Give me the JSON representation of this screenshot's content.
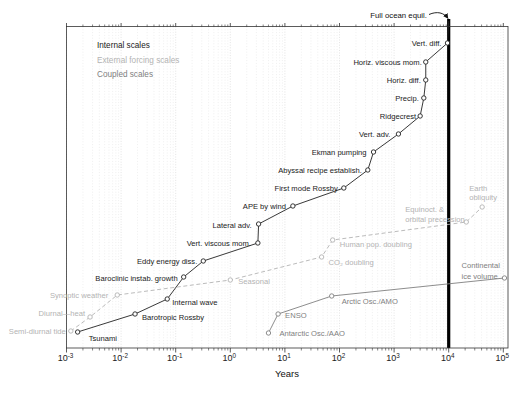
{
  "chart_data": {
    "type": "line",
    "title": "",
    "xlabel": "Years",
    "x_axis": {
      "scale": "log10",
      "min": 0.001,
      "max": 100000,
      "tick_exponents": [
        -3,
        -2,
        -1,
        0,
        1,
        2,
        3,
        4,
        5
      ],
      "unit": "years",
      "grid": "vertical dotted minor log gridlines"
    },
    "y_axis": {
      "visible": false,
      "note": "ordinal staircase, no numeric scale or ticks"
    },
    "legend_position": "top-left inside plot",
    "annotations": {
      "full_ocean_equil": {
        "label": "Full ocean equil.",
        "years": 10000,
        "style": "thick vertical black line with arrow from label"
      }
    },
    "series": [
      {
        "name": "Internal scales",
        "color": "#222222",
        "style": "solid",
        "points": [
          {
            "label": "Tsunami",
            "years": 0.0016,
            "y": 332,
            "dx": 11,
            "dy": 9,
            "anchor": "start"
          },
          {
            "label": "Barotropic Rossby",
            "years": 0.018,
            "y": 314,
            "dx": 7,
            "dy": 6,
            "anchor": "start"
          },
          {
            "label": "Internal wave",
            "years": 0.07,
            "y": 299,
            "dx": 5,
            "dy": 6,
            "anchor": "start"
          },
          {
            "label": "Baroclinic instab. growth",
            "years": 0.14,
            "y": 277,
            "dx": -6,
            "dy": 4,
            "anchor": "end"
          },
          {
            "label": "Eddy energy diss.",
            "years": 0.32,
            "y": 261,
            "dx": -6,
            "dy": 3,
            "anchor": "end"
          },
          {
            "label": "Vert. viscous mom.",
            "years": 3.2,
            "y": 243,
            "dx": -7,
            "dy": 3,
            "anchor": "end"
          },
          {
            "label": "Lateral adv.",
            "years": 3.3,
            "y": 224,
            "dx": -7,
            "dy": 4,
            "anchor": "end"
          },
          {
            "label": "APE by wind",
            "years": 14,
            "y": 206,
            "dx": -7,
            "dy": 3,
            "anchor": "end"
          },
          {
            "label": "First mode Rossby",
            "years": 120,
            "y": 188,
            "dx": -6,
            "dy": 3,
            "anchor": "end"
          },
          {
            "label": "Abyssal recipe establish.",
            "years": 330,
            "y": 170,
            "dx": -6,
            "dy": 3,
            "anchor": "end"
          },
          {
            "label": "Ekman pumping",
            "years": 420,
            "y": 152,
            "dx": -7,
            "dy": 3,
            "anchor": "end"
          },
          {
            "label": "Vert. adv.",
            "years": 1200,
            "y": 134,
            "dx": -8,
            "dy": 3,
            "anchor": "end"
          },
          {
            "label": "Ridgecrest",
            "years": 3000,
            "y": 116,
            "dx": -4,
            "dy": 3,
            "anchor": "end"
          },
          {
            "label": "Precip.",
            "years": 3500,
            "y": 98,
            "dx": -5,
            "dy": 3,
            "anchor": "end"
          },
          {
            "label": "Horiz. diff.",
            "years": 3800,
            "y": 80,
            "dx": -5,
            "dy": 3,
            "anchor": "end"
          },
          {
            "label": "Horiz. viscous mom.",
            "years": 3800,
            "y": 62,
            "dx": -4,
            "dy": 3,
            "anchor": "end"
          },
          {
            "label": "Vert. diff.",
            "years": 9500,
            "y": 43,
            "dx": -6,
            "dy": 3,
            "anchor": "end"
          },
          {
            "label": "",
            "years": 10000,
            "y": 21,
            "marker": false
          }
        ]
      },
      {
        "name": "External forcing scales",
        "color": "#b3b3b3",
        "style": "dashed",
        "points": [
          {
            "label": "Semi-diurnal tide",
            "years": 0.0012,
            "y": 331,
            "dx": -5,
            "dy": 3,
            "anchor": "end"
          },
          {
            "label": "Diurnal—heat",
            "years": 0.0027,
            "y": 317,
            "dx": -5,
            "dy": -1,
            "anchor": "end"
          },
          {
            "label": "Synoptic weather",
            "years": 0.0085,
            "y": 295,
            "dx": -9,
            "dy": 3,
            "anchor": "end"
          },
          {
            "label": "Seasonal",
            "years": 1.0,
            "y": 280,
            "dx": 8,
            "dy": 4,
            "anchor": "start"
          },
          {
            "label": "CO₂ doubling",
            "years": 47,
            "y": 257,
            "dx": 7,
            "dy": 8,
            "anchor": "start"
          },
          {
            "label": "Human pop. doubling",
            "years": 75,
            "y": 240,
            "dx": 7,
            "dy": 7,
            "anchor": "start"
          },
          {
            "label": "Equinoct. &\norbital precession",
            "years": 21000,
            "y": 222,
            "dx": -61,
            "dy": -10,
            "anchor": "start",
            "lh": 10
          },
          {
            "label": "Earth\nobliquity",
            "years": 41000,
            "y": 207,
            "dx": -13,
            "dy": -16,
            "anchor": "start",
            "lh": 9
          }
        ]
      },
      {
        "name": "Coupled scales",
        "color": "#808080",
        "style": "solid",
        "points": [
          {
            "label": "Antarctic Osc./AAO",
            "years": 5,
            "y": 333,
            "dx": 11,
            "dy": 3,
            "anchor": "start"
          },
          {
            "label": "ENSO",
            "years": 7.5,
            "y": 314,
            "dx": 7,
            "dy": 4,
            "anchor": "start"
          },
          {
            "label": "Arctic Osc./AMO",
            "years": 72,
            "y": 296,
            "dx": 10,
            "dy": 8,
            "anchor": "start"
          },
          {
            "label": "Continental\nice volume",
            "years": 105000,
            "y": 278,
            "dx": -43,
            "dy": -10,
            "anchor": "start",
            "lh": 11
          }
        ]
      }
    ],
    "colors": {
      "background": "#ffffff",
      "frame": "#333333",
      "grid_minor": "#dedede",
      "grid_major": "#d0d0d0",
      "equilibrium_line": "#000000"
    }
  },
  "legend": {
    "items": [
      {
        "label": "Internal scales"
      },
      {
        "label": "External forcing scales"
      },
      {
        "label": "Coupled scales"
      }
    ]
  }
}
